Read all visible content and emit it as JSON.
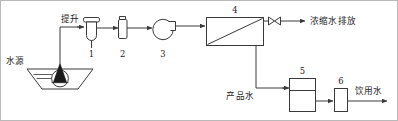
{
  "diagram": {
    "width": 398,
    "height": 121,
    "line_color": "#3a3a3a",
    "text_color": "#1d1d1d",
    "frame_color": "#b9b9b9",
    "background": "#ffffff"
  },
  "labels": {
    "water_source": "水源",
    "lift": "提升",
    "concentrate_discharge": "浓缩水排放",
    "product_water": "产品水",
    "drinking_water": "饮用水"
  },
  "components": [
    {
      "id": "1",
      "number": "1",
      "icon": "vertical-tank-icon",
      "role": "pre-filter-tank"
    },
    {
      "id": "2",
      "number": "2",
      "icon": "cartridge-filter-icon",
      "role": "cartridge-filter"
    },
    {
      "id": "3",
      "number": "3",
      "icon": "pump-icon",
      "role": "high-pressure-pump"
    },
    {
      "id": "4",
      "number": "4",
      "icon": "membrane-module-icon",
      "role": "reverse-osmosis-membrane-module"
    },
    {
      "id": "5",
      "number": "5",
      "icon": "storage-tank-icon",
      "role": "product-water-storage-tank"
    },
    {
      "id": "6",
      "number": "6",
      "icon": "disinfection-unit-icon",
      "role": "disinfection-unit"
    }
  ],
  "symbols": {
    "valve": "bowtie-valve-icon",
    "submersible_pump": "submersible-pump-icon",
    "reservoir": "reservoir-basin-icon"
  },
  "flows": [
    {
      "from": "water-source",
      "to": "1",
      "label": "提升"
    },
    {
      "from": "1",
      "to": "2",
      "label": ""
    },
    {
      "from": "2",
      "to": "3",
      "label": ""
    },
    {
      "from": "3",
      "to": "4",
      "label": ""
    },
    {
      "from": "4",
      "to": "concentrate-outlet",
      "label": "浓缩水排放"
    },
    {
      "from": "4",
      "to": "5",
      "label": "产品水"
    },
    {
      "from": "5",
      "to": "6",
      "label": ""
    },
    {
      "from": "6",
      "to": "drinking-outlet",
      "label": "饮用水"
    }
  ]
}
